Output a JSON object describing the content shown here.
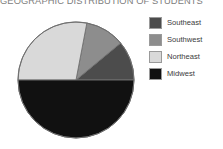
{
  "chart_data": {
    "type": "pie",
    "title": "GEOGRAPHIC DISTRIBUTION OF STUDENTS",
    "xlabel": "",
    "ylabel": "",
    "legend_position": "right",
    "grid": false,
    "categories": [
      "Southeast",
      "Southwest",
      "Northeast",
      "Midwest"
    ],
    "values": [
      11,
      11,
      28,
      50
    ],
    "units": "percent",
    "start_angle_deg": 0,
    "direction": "counterclockwise",
    "slices": [
      {
        "label": "Southeast",
        "value": 11,
        "color": "#4c4c4c",
        "start_deg": 0,
        "end_deg": 39.6
      },
      {
        "label": "Southwest",
        "value": 11,
        "color": "#8d8d8d",
        "start_deg": 39.6,
        "end_deg": 79.2
      },
      {
        "label": "Northeast",
        "value": 28,
        "color": "#d9d9d9",
        "start_deg": 79.2,
        "end_deg": 180.0
      },
      {
        "label": "Midwest",
        "value": 50,
        "color": "#111111",
        "start_deg": 180.0,
        "end_deg": 360.0
      }
    ]
  },
  "legend": {
    "items": [
      {
        "label": "Southeast",
        "color": "#4c4c4c",
        "swatch_name": "legend-swatch-southeast"
      },
      {
        "label": "Southwest",
        "color": "#8d8d8d",
        "swatch_name": "legend-swatch-southwest"
      },
      {
        "label": "Northeast",
        "color": "#d9d9d9",
        "swatch_name": "legend-swatch-northeast"
      },
      {
        "label": "Midwest",
        "color": "#111111",
        "swatch_name": "legend-swatch-midwest"
      }
    ]
  },
  "style": {
    "title_color": "#7d7d7d",
    "label_color": "#3b3b3b",
    "pie_outline": "#6f6f6f",
    "background": "#ffffff"
  }
}
